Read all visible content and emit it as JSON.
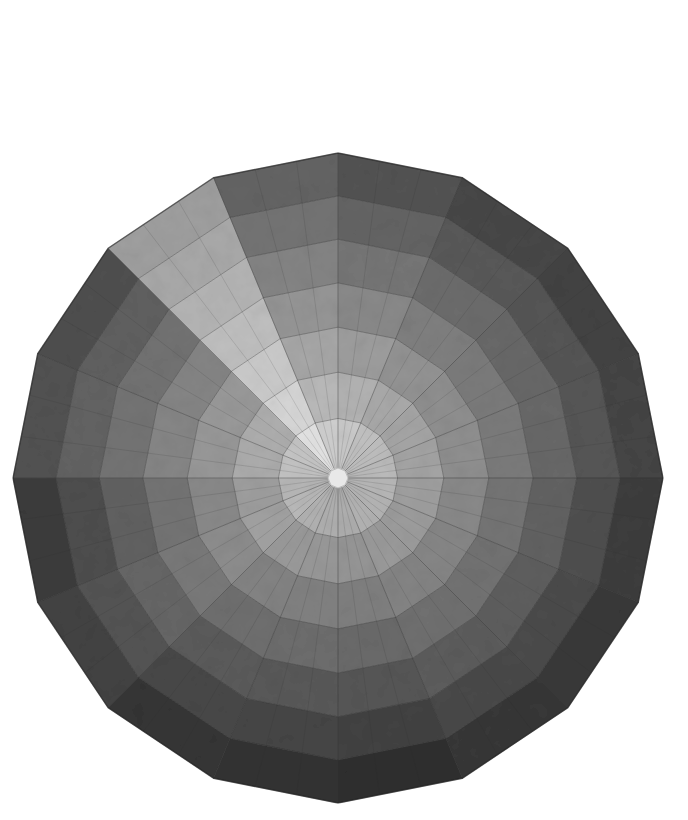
{
  "image": {
    "subject": "Radial 16-sided grayscale quilt with concentric rings and wedge sectors",
    "background": "#ffffff",
    "center": [
      338,
      478
    ],
    "radius": 325,
    "sides": 16,
    "rings": 7,
    "center_disc_color": "#e8e8e8",
    "seam_color": "#5a5a5a",
    "wedge_outer_tones": [
      "#4a4a4a",
      "#3e3e3e",
      "#3a3a3a",
      "#3c3c3c",
      "#343434",
      "#303030",
      "#2e2e2e",
      "#262626",
      "#2a2a2a",
      "#2c2c2c",
      "#3a3a3a",
      "#333333",
      "#4a4a4a",
      "#464646",
      "#9a9a9a",
      "#5c5c5c"
    ],
    "wedge_inner_tones": [
      "#d8d8d8",
      "#d0d0d0",
      "#cccccc",
      "#cacaca",
      "#c6c6c6",
      "#c4c4c4",
      "#c2c2c2",
      "#bebebe",
      "#c0c0c0",
      "#c2c2c2",
      "#c8c8c8",
      "#c6c6c6",
      "#d0d0d0",
      "#d4d4d4",
      "#ececec",
      "#dcdcdc"
    ]
  }
}
